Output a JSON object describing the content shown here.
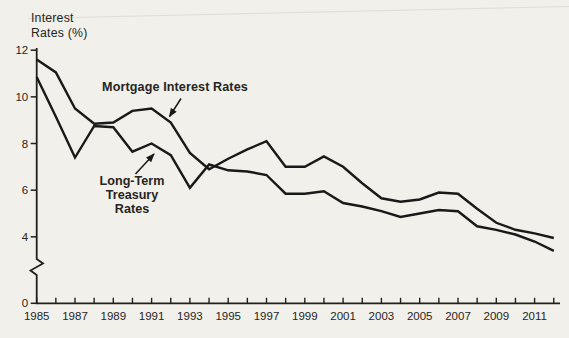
{
  "figure": {
    "y_axis_title_line1": "Interest",
    "y_axis_title_line2": "Rates (%)",
    "annotations": {
      "mortgage": "Mortgage Interest Rates",
      "treasury_line1": "Long-Term",
      "treasury_line2": "Treasury",
      "treasury_line3": "Rates"
    }
  },
  "colors": {
    "line": "#191919",
    "axis": "#21201b",
    "text": "#26251f",
    "paper": "#f1f0ea",
    "artifact_line": "#d8d6cf"
  },
  "chart_data": {
    "type": "line",
    "title": "",
    "xlabel": "",
    "ylabel": "Interest Rates (%)",
    "grid": false,
    "legend_position": "inline-annotations",
    "y_axis_break_between": [
      0,
      4
    ],
    "ylim_display": [
      0,
      12
    ],
    "y_ticks": [
      12,
      10,
      8,
      6,
      4,
      0
    ],
    "x_tick_labels": [
      "1985",
      "1987",
      "1989",
      "1991",
      "1993",
      "1995",
      "1997",
      "1999",
      "2001",
      "2003",
      "2005",
      "2007",
      "2009",
      "2011"
    ],
    "x": [
      1985,
      1986,
      1987,
      1988,
      1989,
      1990,
      1991,
      1992,
      1993,
      1994,
      1995,
      1996,
      1997,
      1998,
      1999,
      2000,
      2001,
      2002,
      2003,
      2004,
      2005,
      2006,
      2007,
      2008,
      2009,
      2010,
      2011,
      2012
    ],
    "series": [
      {
        "name": "Mortgage Interest Rates",
        "values": [
          11.6,
          11.05,
          9.5,
          8.85,
          8.9,
          9.4,
          9.5,
          8.9,
          7.6,
          6.9,
          7.35,
          7.75,
          8.1,
          7.0,
          7.0,
          7.45,
          7.0,
          6.3,
          5.65,
          5.5,
          5.6,
          5.9,
          5.85,
          5.2,
          4.6,
          4.3,
          4.15,
          3.95
        ]
      },
      {
        "name": "Long-Term Treasury Rates",
        "values": [
          10.85,
          9.15,
          7.4,
          8.75,
          8.7,
          7.65,
          8.0,
          7.5,
          6.1,
          7.1,
          6.85,
          6.8,
          6.65,
          5.85,
          5.85,
          5.95,
          5.45,
          5.3,
          5.1,
          4.85,
          5.0,
          5.15,
          5.1,
          4.45,
          4.3,
          4.1,
          3.8,
          3.4
        ]
      }
    ]
  }
}
